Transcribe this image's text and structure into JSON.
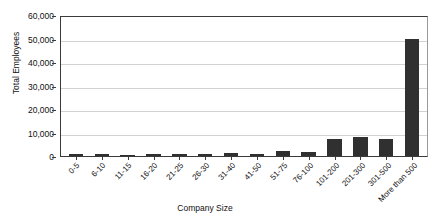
{
  "chart_data": {
    "type": "bar",
    "title": "",
    "xlabel": "Company Size",
    "ylabel": "Total Employees",
    "ylim": [
      0,
      60000
    ],
    "ytick_step": 10000,
    "grid": true,
    "legend": "none",
    "bar_color": "#303030",
    "categories": [
      "0-5",
      "6-10",
      "11-15",
      "16-20",
      "21-25",
      "26-30",
      "31-40",
      "41-50",
      "51-75",
      "76-100",
      "101-200",
      "201-300",
      "301-500",
      "More than 500"
    ],
    "values": [
      700,
      900,
      600,
      900,
      800,
      900,
      1300,
      700,
      2200,
      1800,
      7200,
      7900,
      7200,
      50000
    ],
    "ytick_labels": [
      "0",
      "10,000",
      "20,000",
      "30,000",
      "40,000",
      "50,000",
      "60,000"
    ],
    "ytick_values": [
      0,
      10000,
      20000,
      30000,
      40000,
      50000,
      60000
    ]
  }
}
